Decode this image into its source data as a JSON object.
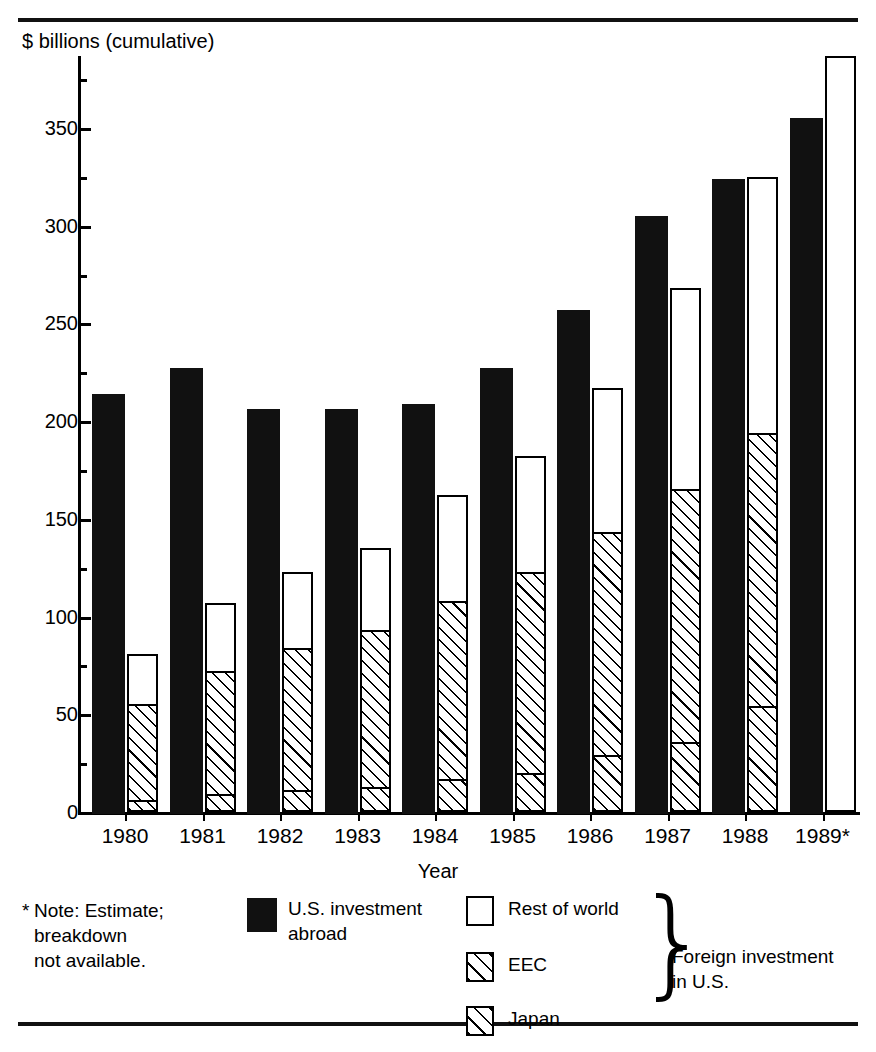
{
  "chart_data": {
    "type": "bar",
    "title": "",
    "ylabel": "$ billions (cumulative)",
    "xlabel": "Year",
    "ylim": [
      0,
      390
    ],
    "ytick_labels": [
      "0",
      "50",
      "100",
      "150",
      "200",
      "250",
      "300",
      "350"
    ],
    "ytick_values": [
      0,
      50,
      100,
      150,
      200,
      250,
      300,
      350
    ],
    "minor_tick_interval": 25,
    "grid": false,
    "legend_position": "bottom",
    "categories": [
      "1980",
      "1981",
      "1982",
      "1983",
      "1984",
      "1985",
      "1986",
      "1987",
      "1988",
      "1989*"
    ],
    "series": [
      {
        "name": "U.S. investment abroad",
        "key": "us-abroad",
        "pattern": "solid-black",
        "values": [
          214,
          227,
          206,
          206,
          209,
          227,
          257,
          305,
          324,
          355
        ]
      },
      {
        "name": "Japan",
        "key": "japan",
        "pattern": "crosshatch",
        "stack": "foreign",
        "values": [
          4,
          7,
          9,
          11,
          15,
          18,
          27,
          34,
          52,
          null
        ]
      },
      {
        "name": "EEC",
        "key": "eec",
        "pattern": "diagonal-hatch",
        "stack": "foreign",
        "values": [
          53,
          70,
          82,
          91,
          106,
          121,
          141,
          163,
          192,
          null
        ]
      },
      {
        "name": "Rest of world",
        "key": "rest-of-world",
        "pattern": "white",
        "stack": "foreign",
        "values": [
          24,
          30,
          32,
          33,
          41,
          43,
          49,
          71,
          81,
          null
        ]
      }
    ],
    "stack_totals": {
      "name": "Foreign investment in U.S.",
      "values": [
        81,
        107,
        123,
        135,
        162,
        182,
        217,
        268,
        325,
        387
      ]
    },
    "annotations": {
      "estimate_note": "1989 is an estimate; breakdown not available."
    }
  },
  "axes": {
    "y_title": "$ billions (cumulative)",
    "x_title": "Year",
    "y_ticks": [
      "350",
      "300",
      "250",
      "200",
      "150",
      "100",
      "50",
      "0"
    ]
  },
  "legend": {
    "note_star": "*",
    "note_line1": "Note: Estimate;",
    "note_line2": "breakdown",
    "note_line3": "not available.",
    "us_label_line1": "U.S. investment",
    "us_label_line2": "abroad",
    "rest_label": "Rest of world",
    "eec_label": "EEC",
    "japan_label": "Japan",
    "brace_glyph": "}",
    "group_label_line1": "Foreign investment",
    "group_label_line2": "in U.S."
  },
  "colors": {
    "ink": "#111111",
    "paper": "#ffffff"
  }
}
